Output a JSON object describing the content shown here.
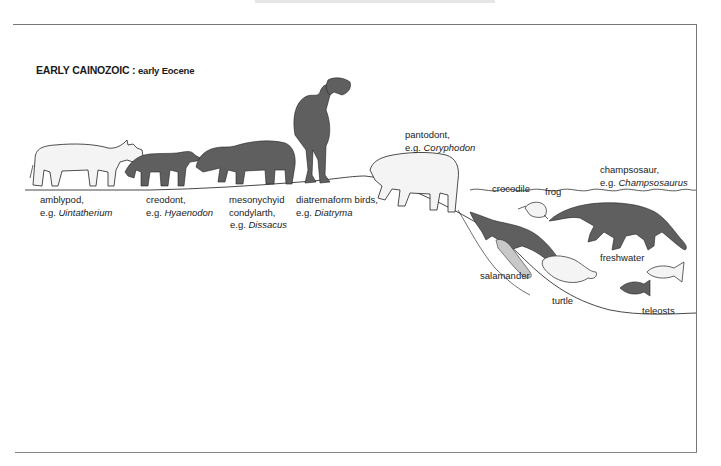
{
  "title": {
    "era": "EARLY CAINOZOIC :",
    "epoch": "early Eocene"
  },
  "colors": {
    "dark_fill": "#5f5f5f",
    "light_fill": "#f4f4f4",
    "outline": "#222222",
    "frame": "#777777"
  },
  "labels": [
    {
      "id": "amblypod",
      "line1": "amblypod,",
      "eg": "e.g. ",
      "genus": "Uintatherium"
    },
    {
      "id": "creodont",
      "line1": "creodont,",
      "eg": "e.g. ",
      "genus": "Hyaenodon"
    },
    {
      "id": "mesonychid",
      "line1": "mesonychyid",
      "line2": "condylarth,",
      "eg": "e.g. ",
      "genus": "Dissacus"
    },
    {
      "id": "diatremaform",
      "line1": "diatremaform birds,",
      "eg": "e.g. ",
      "genus": "Diatryma"
    },
    {
      "id": "pantodont",
      "line1": "pantodont,",
      "eg": "e.g. ",
      "genus": "Coryphodon"
    },
    {
      "id": "crocodile",
      "line1": "crocodile"
    },
    {
      "id": "frog",
      "line1": "frog"
    },
    {
      "id": "champsosaur",
      "line1": "champsosaur,",
      "eg": "e.g. ",
      "genus": "Champsosaurus"
    },
    {
      "id": "salamander",
      "line1": "salamander"
    },
    {
      "id": "turtle",
      "line1": "turtle"
    },
    {
      "id": "freshwater",
      "line1": "freshwater"
    },
    {
      "id": "teleosts",
      "line1": "teleosts"
    }
  ]
}
